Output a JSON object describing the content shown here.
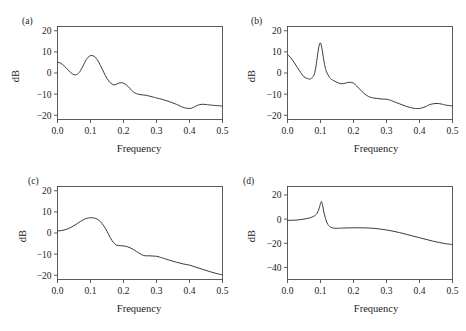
{
  "figure": {
    "panel_count": 4,
    "background_color": "#ffffff",
    "line_color": "#3a3a3a",
    "axis_color": "#4a4a4a"
  },
  "panels": [
    {
      "tag": "(a)",
      "xlabel": "Frequency",
      "ylabel": "dB",
      "xticks": [
        "0.0",
        "0.1",
        "0.2",
        "0.3",
        "0.4",
        "0.5"
      ],
      "yticks": [
        "20",
        "10",
        "0",
        "-10",
        "-20"
      ]
    },
    {
      "tag": "(b)",
      "xlabel": "Frequency",
      "ylabel": "dB",
      "xticks": [
        "0.0",
        "0.1",
        "0.2",
        "0.3",
        "0.4",
        "0.5"
      ],
      "yticks": [
        "20",
        "10",
        "0",
        "-10",
        "-20"
      ]
    },
    {
      "tag": "(c)",
      "xlabel": "Frequency",
      "ylabel": "dB",
      "xticks": [
        "0.0",
        "0.1",
        "0.2",
        "0.3",
        "0.4",
        "0.5"
      ],
      "yticks": [
        "20",
        "10",
        "0",
        "-10",
        "-20"
      ]
    },
    {
      "tag": "(d)",
      "xlabel": "Frequency",
      "ylabel": "dB",
      "xticks": [
        "0.0",
        "0.1",
        "0.2",
        "0.3",
        "0.4",
        "0.5"
      ],
      "yticks": [
        "20",
        "0",
        "-20",
        "-40"
      ]
    }
  ],
  "chart_data": [
    {
      "type": "line",
      "panel": "(a)",
      "title": "",
      "xlabel": "Frequency",
      "ylabel": "dB",
      "xlim": [
        0.0,
        0.5
      ],
      "ylim": [
        -22,
        22
      ],
      "xticks": [
        0.0,
        0.1,
        0.2,
        0.3,
        0.4,
        0.5
      ],
      "yticks": [
        20,
        10,
        0,
        -10,
        -20
      ],
      "grid": false,
      "legend": false,
      "series": [
        {
          "name": "spectrum-a",
          "x": [
            0.0,
            0.01,
            0.02,
            0.03,
            0.04,
            0.05,
            0.06,
            0.07,
            0.08,
            0.09,
            0.1,
            0.11,
            0.12,
            0.13,
            0.14,
            0.15,
            0.16,
            0.17,
            0.18,
            0.19,
            0.2,
            0.21,
            0.22,
            0.23,
            0.24,
            0.25,
            0.26,
            0.27,
            0.28,
            0.29,
            0.3,
            0.32,
            0.34,
            0.36,
            0.38,
            0.39,
            0.4,
            0.41,
            0.42,
            0.43,
            0.44,
            0.45,
            0.46,
            0.48,
            0.5
          ],
          "y": [
            5.2,
            4.6,
            3.4,
            1.8,
            0.2,
            -0.8,
            -0.6,
            1.2,
            4.2,
            7.0,
            8.2,
            8.0,
            6.4,
            3.6,
            0.4,
            -2.6,
            -4.6,
            -5.6,
            -5.2,
            -4.6,
            -4.8,
            -5.8,
            -7.4,
            -9.0,
            -9.8,
            -10.2,
            -10.4,
            -10.6,
            -11.0,
            -11.4,
            -11.8,
            -12.6,
            -13.6,
            -14.8,
            -16.2,
            -16.6,
            -16.8,
            -16.4,
            -15.6,
            -15.0,
            -14.8,
            -14.9,
            -15.1,
            -15.4,
            -15.6
          ]
        }
      ]
    },
    {
      "type": "line",
      "panel": "(b)",
      "title": "",
      "xlabel": "Frequency",
      "ylabel": "dB",
      "xlim": [
        0.0,
        0.5
      ],
      "ylim": [
        -22,
        22
      ],
      "xticks": [
        0.0,
        0.1,
        0.2,
        0.3,
        0.4,
        0.5
      ],
      "yticks": [
        20,
        10,
        0,
        -10,
        -20
      ],
      "grid": false,
      "legend": false,
      "series": [
        {
          "name": "spectrum-b",
          "x": [
            0.0,
            0.01,
            0.02,
            0.03,
            0.04,
            0.05,
            0.06,
            0.07,
            0.08,
            0.085,
            0.09,
            0.095,
            0.1,
            0.105,
            0.11,
            0.115,
            0.12,
            0.13,
            0.14,
            0.15,
            0.16,
            0.17,
            0.18,
            0.19,
            0.2,
            0.21,
            0.22,
            0.23,
            0.24,
            0.25,
            0.26,
            0.27,
            0.28,
            0.29,
            0.3,
            0.31,
            0.32,
            0.34,
            0.36,
            0.38,
            0.39,
            0.4,
            0.41,
            0.42,
            0.43,
            0.44,
            0.45,
            0.46,
            0.47,
            0.48,
            0.5
          ],
          "y": [
            8.8,
            7.2,
            5.0,
            2.6,
            0.2,
            -1.8,
            -2.6,
            -2.8,
            -1.0,
            2.0,
            7.2,
            12.4,
            14.2,
            11.0,
            6.0,
            2.2,
            0.0,
            -2.6,
            -3.6,
            -4.4,
            -5.0,
            -5.0,
            -4.6,
            -4.4,
            -4.8,
            -6.2,
            -7.8,
            -9.4,
            -10.6,
            -11.4,
            -11.8,
            -12.0,
            -12.2,
            -12.4,
            -12.4,
            -12.8,
            -13.4,
            -14.6,
            -15.8,
            -16.6,
            -16.8,
            -16.8,
            -16.4,
            -15.8,
            -15.0,
            -14.6,
            -14.4,
            -14.5,
            -14.8,
            -15.2,
            -15.6
          ]
        }
      ]
    },
    {
      "type": "line",
      "panel": "(c)",
      "title": "",
      "xlabel": "Frequency",
      "ylabel": "dB",
      "xlim": [
        0.0,
        0.5
      ],
      "ylim": [
        -22,
        22
      ],
      "xticks": [
        0.0,
        0.1,
        0.2,
        0.3,
        0.4,
        0.5
      ],
      "yticks": [
        20,
        10,
        0,
        -10,
        -20
      ],
      "grid": false,
      "legend": false,
      "series": [
        {
          "name": "spectrum-c",
          "x": [
            0.0,
            0.01,
            0.02,
            0.03,
            0.04,
            0.05,
            0.06,
            0.07,
            0.08,
            0.09,
            0.1,
            0.11,
            0.12,
            0.13,
            0.14,
            0.15,
            0.16,
            0.17,
            0.18,
            0.19,
            0.2,
            0.21,
            0.22,
            0.23,
            0.24,
            0.25,
            0.26,
            0.27,
            0.28,
            0.29,
            0.3,
            0.31,
            0.32,
            0.34,
            0.36,
            0.38,
            0.4,
            0.42,
            0.44,
            0.46,
            0.48,
            0.5
          ],
          "y": [
            1.0,
            1.1,
            1.4,
            1.9,
            2.6,
            3.5,
            4.5,
            5.5,
            6.4,
            7.0,
            7.2,
            7.1,
            6.6,
            5.4,
            3.4,
            0.8,
            -2.2,
            -4.6,
            -5.8,
            -6.0,
            -6.1,
            -6.4,
            -7.0,
            -7.8,
            -8.8,
            -9.8,
            -10.6,
            -10.8,
            -10.8,
            -10.9,
            -11.0,
            -11.4,
            -11.9,
            -12.9,
            -13.8,
            -14.6,
            -15.2,
            -16.2,
            -17.2,
            -18.2,
            -19.1,
            -19.8
          ]
        }
      ]
    },
    {
      "type": "line",
      "panel": "(d)",
      "title": "",
      "xlabel": "Frequency",
      "ylabel": "dB",
      "xlim": [
        0.0,
        0.5
      ],
      "ylim": [
        -50,
        27
      ],
      "xticks": [
        0.0,
        0.1,
        0.2,
        0.3,
        0.4,
        0.5
      ],
      "yticks": [
        20,
        0,
        -20,
        -40
      ],
      "grid": false,
      "legend": false,
      "series": [
        {
          "name": "spectrum-d",
          "x": [
            0.0,
            0.01,
            0.02,
            0.03,
            0.04,
            0.05,
            0.06,
            0.07,
            0.08,
            0.085,
            0.09,
            0.095,
            0.1,
            0.103,
            0.106,
            0.11,
            0.115,
            0.12,
            0.125,
            0.13,
            0.135,
            0.14,
            0.15,
            0.16,
            0.18,
            0.2,
            0.22,
            0.24,
            0.26,
            0.28,
            0.3,
            0.32,
            0.34,
            0.36,
            0.38,
            0.4,
            0.42,
            0.44,
            0.46,
            0.48,
            0.5
          ],
          "y": [
            -1.0,
            -1.0,
            -0.9,
            -0.7,
            -0.4,
            0.0,
            0.5,
            1.2,
            2.4,
            3.4,
            5.0,
            8.2,
            12.8,
            14.6,
            12.0,
            6.0,
            0.6,
            -3.2,
            -5.4,
            -6.6,
            -7.2,
            -7.5,
            -7.6,
            -7.5,
            -7.3,
            -7.2,
            -7.2,
            -7.3,
            -7.6,
            -8.2,
            -9.0,
            -10.0,
            -11.2,
            -12.6,
            -14.0,
            -15.4,
            -16.8,
            -18.2,
            -19.4,
            -20.4,
            -21.0
          ]
        }
      ]
    }
  ]
}
